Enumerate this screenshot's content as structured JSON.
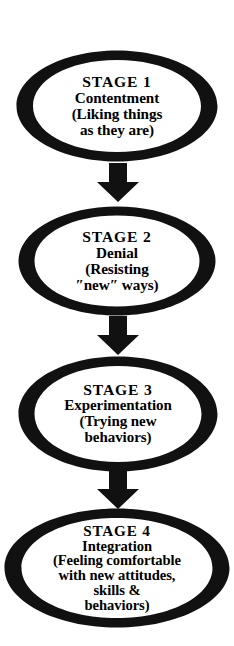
{
  "diagram": {
    "orientation": "vertical-top-to-bottom",
    "node_shape": "ellipse",
    "stroke_color": "#000000",
    "fill_color": "#ffffff",
    "text_color": "#000000",
    "arrow_color": "#000000",
    "stages": [
      {
        "id": "stage-1",
        "title": "STAGE 1",
        "name": "Contentment",
        "lines": [
          "STAGE 1",
          "Contentment",
          "(Liking things",
          "as they are)"
        ]
      },
      {
        "id": "stage-2",
        "title": "STAGE 2",
        "name": "Denial",
        "lines": [
          "STAGE 2",
          "Denial",
          "(Resisting",
          "″new″ ways)"
        ]
      },
      {
        "id": "stage-3",
        "title": "STAGE 3",
        "name": "Experimentation",
        "lines": [
          "STAGE 3",
          "Experimentation",
          "(Trying new",
          "behaviors)"
        ]
      },
      {
        "id": "stage-4",
        "title": "STAGE 4",
        "name": "Integration",
        "lines": [
          "STAGE 4",
          "Integration",
          "(Feeling comfortable",
          "with new attitudes,",
          "skills &",
          "behaviors)"
        ]
      }
    ],
    "connectors": [
      {
        "id": "connector-1",
        "from": "stage-1",
        "to": "stage-2",
        "icon": "down-arrow-icon"
      },
      {
        "id": "connector-2",
        "from": "stage-2",
        "to": "stage-3",
        "icon": "down-arrow-icon"
      },
      {
        "id": "connector-3",
        "from": "stage-3",
        "to": "stage-4",
        "icon": "down-arrow-icon"
      }
    ]
  }
}
